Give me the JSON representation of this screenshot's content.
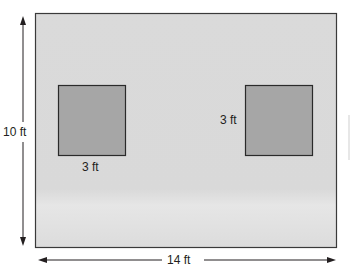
{
  "diagram": {
    "title": "",
    "room": {
      "width_label": "14 ft",
      "height_label": "10 ft",
      "fill": "#dcdcdc",
      "stroke": "#3a3a3a"
    },
    "squares": [
      {
        "name": "left-square",
        "side_label": "3 ft",
        "label_position": "bottom",
        "fill": "#a6a6a6"
      },
      {
        "name": "right-square",
        "side_label": "3 ft",
        "label_position": "left",
        "fill": "#a6a6a6"
      }
    ]
  }
}
